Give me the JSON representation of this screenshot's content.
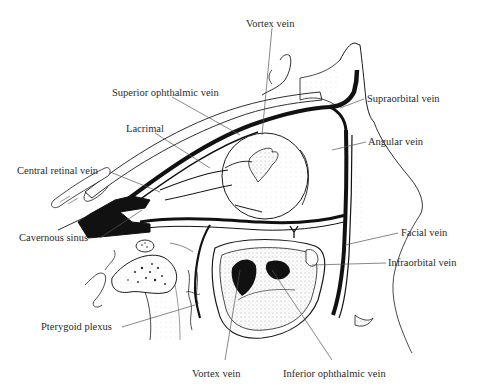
{
  "figure": {
    "background_color": "#ffffff",
    "ink_color": "#1a1a1a",
    "leader_color": "#555555"
  },
  "labels": {
    "vortex_vein_top": "Vortex vein",
    "superior_ophthalmic_vein": "Superior ophthalmic vein",
    "supraorbital_vein": "Supraorbital vein",
    "lacrimal": "Lacrimal",
    "angular_vein": "Angular vein",
    "central_retinal_vein": "Central retinal vein",
    "cavernous_sinus": "Cavernous sinus",
    "facial_vein": "Facial vein",
    "infraorbital_vein": "Infraorbital vein",
    "pterygoid_plexus": "Pterygoid plexus",
    "vortex_vein_bottom": "Vortex vein",
    "inferior_ophthalmic_vein": "Inferior ophthalmic vein"
  }
}
